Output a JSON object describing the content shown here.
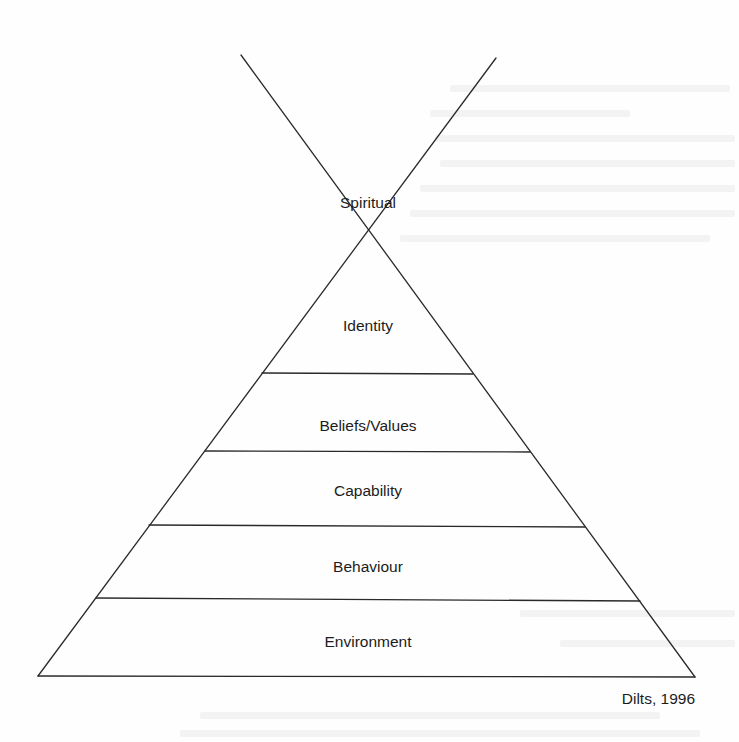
{
  "diagram": {
    "citation": "Dilts, 1996",
    "levels": [
      {
        "label": "Spiritual"
      },
      {
        "label": "Identity"
      },
      {
        "label": "Beliefs/Values"
      },
      {
        "label": "Capability"
      },
      {
        "label": "Behaviour"
      },
      {
        "label": "Environment"
      }
    ],
    "colors": {
      "line": "#2a2a2a",
      "text": "#1c1c1c",
      "background": "#fefefe"
    }
  }
}
